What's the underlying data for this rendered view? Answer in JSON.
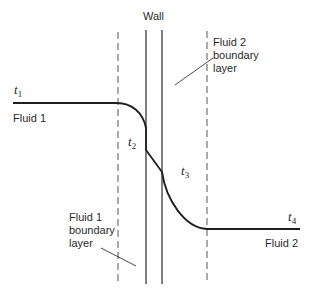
{
  "diagram": {
    "wall_label": "Wall",
    "fluid1_label": "Fluid 1",
    "fluid2_label": "Fluid 2",
    "fluid1_boundary_layer_label": "Fluid 1\nboundary\nlayer",
    "fluid2_boundary_layer_label": "Fluid 2\nboundary\nlayer",
    "temperatures": [
      {
        "symbol": "t",
        "subscript": "1"
      },
      {
        "symbol": "t",
        "subscript": "2"
      },
      {
        "symbol": "t",
        "subscript": "3"
      },
      {
        "symbol": "t",
        "subscript": "4"
      }
    ],
    "colors": {
      "line": "#1e1e1e",
      "dashed": "#555555",
      "text": "#2a2a2a",
      "background": "#ffffff"
    }
  }
}
